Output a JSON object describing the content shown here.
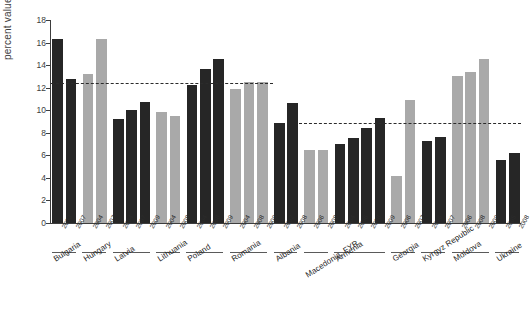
{
  "chart_data": {
    "type": "bar",
    "title": "",
    "xlabel": "",
    "ylabel": "percent values",
    "ylim": [
      0,
      18
    ],
    "yticks": [
      0,
      2,
      4,
      6,
      8,
      10,
      12,
      14,
      16,
      18
    ],
    "grid": false,
    "legend": null,
    "colors": {
      "dark_bar": "#262626",
      "light_bar": "#a9a9a9",
      "reference_line": "#2b2b2b",
      "axis": "#3d3d3d",
      "background": "#ffffff"
    },
    "annotations": [
      {
        "label": "reference level (EU group)",
        "value": 12.4,
        "style": "dashed",
        "span": "Bulgaria-Romania"
      },
      {
        "label": "reference level (non-EU group)",
        "value": 8.9,
        "style": "dashed",
        "span": "Macedonia, FYR-Ukraine"
      }
    ],
    "categories": [
      "Bulgaria",
      "Hungary",
      "Latvia",
      "Lithuania",
      "Poland",
      "Romania",
      "Albania",
      "Macedonia, FYR",
      "Armenia",
      "Georgia",
      "Kyrgyz Republic",
      "Moldova",
      "Ukraine"
    ],
    "groups": [
      {
        "country": "Bulgaria",
        "shade": "dark",
        "bars": [
          {
            "year": "2003",
            "value": 16.3
          },
          {
            "year": "2007",
            "value": 12.8
          }
        ]
      },
      {
        "country": "Hungary",
        "shade": "light",
        "bars": [
          {
            "year": "2004",
            "value": 13.2
          },
          {
            "year": "2007",
            "value": 16.3
          }
        ]
      },
      {
        "country": "Latvia",
        "shade": "dark",
        "bars": [
          {
            "year": "2004",
            "value": 9.2
          },
          {
            "year": "2007",
            "value": 10.0
          },
          {
            "year": "2009",
            "value": 10.7
          }
        ]
      },
      {
        "country": "Lithuania",
        "shade": "light",
        "bars": [
          {
            "year": "2004",
            "value": 9.8
          },
          {
            "year": "2008",
            "value": 9.5
          }
        ]
      },
      {
        "country": "Poland",
        "shade": "dark",
        "bars": [
          {
            "year": "2004",
            "value": 12.2
          },
          {
            "year": "2008",
            "value": 13.7
          },
          {
            "year": "2009",
            "value": 14.5
          }
        ]
      },
      {
        "country": "Romania",
        "shade": "light",
        "bars": [
          {
            "year": "2004",
            "value": 11.9
          },
          {
            "year": "2008",
            "value": 12.5
          },
          {
            "year": "2009",
            "value": 12.5
          }
        ]
      },
      {
        "country": "Albania",
        "shade": "dark",
        "bars": [
          {
            "year": "2002",
            "value": 8.9
          },
          {
            "year": "2008",
            "value": 10.6
          }
        ]
      },
      {
        "country": "Macedonia, FYR",
        "shade": "light",
        "bars": [
          {
            "year": "2006",
            "value": 6.5
          },
          {
            "year": "2008",
            "value": 6.5
          }
        ]
      },
      {
        "country": "Armenia",
        "shade": "dark",
        "bars": [
          {
            "year": "2004",
            "value": 7.0
          },
          {
            "year": "2006",
            "value": 7.5
          },
          {
            "year": "2008",
            "value": 8.4
          },
          {
            "year": "2009",
            "value": 9.3
          }
        ]
      },
      {
        "country": "Georgia",
        "shade": "light",
        "bars": [
          {
            "year": "2006",
            "value": 4.2
          },
          {
            "year": "2007",
            "value": 10.9
          }
        ]
      },
      {
        "country": "Kyrgyz Republic",
        "shade": "dark",
        "bars": [
          {
            "year": "2006",
            "value": 7.3
          },
          {
            "year": "2007",
            "value": 7.6
          }
        ]
      },
      {
        "country": "Moldova",
        "shade": "light",
        "bars": [
          {
            "year": "2006",
            "value": 13.0
          },
          {
            "year": "2008",
            "value": 13.4
          },
          {
            "year": "2009",
            "value": 14.5
          }
        ]
      },
      {
        "country": "Ukraine",
        "shade": "dark",
        "bars": [
          {
            "year": "2005",
            "value": 5.6
          },
          {
            "year": "2008",
            "value": 6.2
          }
        ]
      }
    ]
  }
}
